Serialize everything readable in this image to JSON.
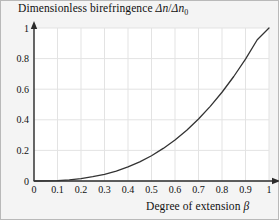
{
  "chart_data": {
    "type": "line",
    "title": "",
    "ylabel": "Dimensionless birefringence Δn/Δn₀",
    "xlabel": "Degree of extension β",
    "xlim": [
      0,
      1
    ],
    "ylim": [
      0,
      1
    ],
    "grid": true,
    "legend": null,
    "xticks": [
      "0",
      "0.1",
      "0.2",
      "0.3",
      "0.4",
      "0.5",
      "0.6",
      "0.7",
      "0.8",
      "0.9",
      "1"
    ],
    "xtick_values": [
      0,
      0.1,
      0.2,
      0.3,
      0.4,
      0.5,
      0.6,
      0.7,
      0.8,
      0.9,
      1
    ],
    "yticks": [
      "0",
      "0.2",
      "0.4",
      "0.6",
      "0.8",
      "1"
    ],
    "ytick_values": [
      0,
      0.2,
      0.4,
      0.6,
      0.8,
      1
    ],
    "series": [
      {
        "name": "Dimensionless birefringence",
        "color": "#333333",
        "x": [
          0,
          0.05,
          0.1,
          0.15,
          0.2,
          0.25,
          0.3,
          0.35,
          0.4,
          0.45,
          0.5,
          0.55,
          0.6,
          0.65,
          0.7,
          0.75,
          0.8,
          0.85,
          0.9,
          0.95,
          1
        ],
        "values": [
          0,
          0.0003,
          0.003,
          0.008,
          0.016,
          0.028,
          0.044,
          0.065,
          0.092,
          0.125,
          0.165,
          0.213,
          0.268,
          0.332,
          0.405,
          0.488,
          0.58,
          0.683,
          0.797,
          0.923,
          1
        ]
      }
    ],
    "annotations": []
  },
  "axis_labels": {
    "y_title_prefix": "Dimensionless birefringence ",
    "y_title_delta_n": "Δn",
    "y_title_slash": "/",
    "y_title_delta_n0": "Δn",
    "y_title_sub": "0",
    "x_title_prefix": "Degree of extension ",
    "x_title_symbol": "β"
  },
  "style": {
    "page_background": "#f4f4f4",
    "plot_background": "#ffffff",
    "grid_color": "#e3e3e3",
    "axis_color": "#2b2b2b",
    "curve_color": "#333333",
    "border_color": "#b9b9b9",
    "tick_text_color": "#111111"
  }
}
